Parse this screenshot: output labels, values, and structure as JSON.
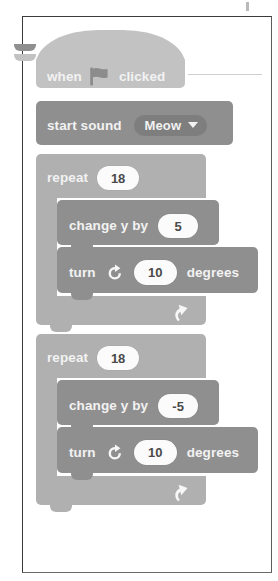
{
  "page": {
    "frame": {
      "visible": true
    }
  },
  "palette": {
    "page_background": "#ffffff",
    "frame_border": "#3a3a3a",
    "event_block": "#c2c2c2",
    "control_block": "#b0b0b0",
    "action_block": "#8f8f8f",
    "dropdown_field": "#7e7e7e",
    "input_oval": "#fbfbfb",
    "label_text": "#f2f2f2",
    "oval_text": "#4a4a4a",
    "leader_line": "#cfcfcf"
  },
  "script": {
    "hat": {
      "prefix_label": "when",
      "icon": "green-flag-icon",
      "suffix_label": "clicked"
    },
    "sound_block": {
      "label": "start sound",
      "dropdown_value": "Meow",
      "dropdown_icon": "chevron-down-icon"
    },
    "loops": [
      {
        "label": "repeat",
        "times": "18",
        "loop_icon": "loop-arrow-icon",
        "body": [
          {
            "type": "change-y-by",
            "label": "change y by",
            "value": "5"
          },
          {
            "type": "turn-right",
            "prefix_label": "turn",
            "icon": "turn-clockwise-icon",
            "value": "10",
            "suffix_label": "degrees"
          }
        ]
      },
      {
        "label": "repeat",
        "times": "18",
        "loop_icon": "loop-arrow-icon",
        "body": [
          {
            "type": "change-y-by",
            "label": "change y by",
            "value": "-5"
          },
          {
            "type": "turn-right",
            "prefix_label": "turn",
            "icon": "turn-clockwise-icon",
            "value": "10",
            "suffix_label": "degrees"
          }
        ]
      }
    ]
  }
}
